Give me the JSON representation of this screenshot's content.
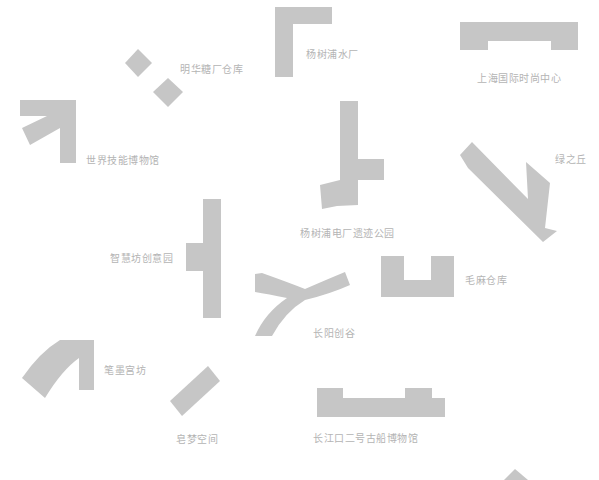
{
  "map": {
    "shape_color": "#c6c6c6",
    "label_color": "#b4b4b4",
    "places": [
      {
        "id": "minghua",
        "label": "明华糖厂仓库"
      },
      {
        "id": "yangshupu-water",
        "label": "杨树浦水厂"
      },
      {
        "id": "fashion-center",
        "label": "上海国际时尚中心"
      },
      {
        "id": "skills-museum",
        "label": "世界技能博物馆"
      },
      {
        "id": "power-plant-park",
        "label": "杨树浦电厂遗迹公园"
      },
      {
        "id": "lv-zhi-qiu",
        "label": "绿之丘"
      },
      {
        "id": "zhihui-fang",
        "label": "智慧坊创意园"
      },
      {
        "id": "changyang",
        "label": "长阳创谷"
      },
      {
        "id": "maoma",
        "label": "毛麻仓库"
      },
      {
        "id": "bixin",
        "label": "笔墨宫坊"
      },
      {
        "id": "huanmeng",
        "label": "皂梦空间"
      },
      {
        "id": "ancient-ship-museum",
        "label": "长江口二号古船博物馆"
      }
    ]
  }
}
